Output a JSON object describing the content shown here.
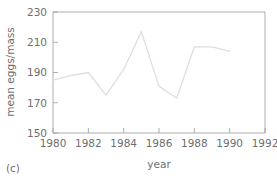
{
  "chart_data": {
    "type": "line",
    "title": "",
    "xlabel": "year",
    "ylabel": "mean eggs/mass",
    "xlim": [
      1980,
      1992
    ],
    "ylim": [
      150,
      230
    ],
    "xticks": [
      1980,
      1982,
      1984,
      1986,
      1988,
      1990,
      1992
    ],
    "xtick_labels": [
      "1980",
      "1982",
      "1984",
      "1986",
      "1988",
      "1990",
      "1992"
    ],
    "yticks": [
      150,
      170,
      190,
      210,
      230
    ],
    "ytick_labels": [
      "150",
      "170",
      "190",
      "210",
      "230"
    ],
    "grid": false,
    "legend": null,
    "line_color": "#dedede",
    "axis_color": "#9a9a9a",
    "text_color": "#6e6e6e",
    "x": [
      1980,
      1981,
      1982,
      1983,
      1984,
      1985,
      1986,
      1987,
      1988,
      1989,
      1990
    ],
    "values": [
      185,
      188,
      190,
      175,
      192,
      217,
      181,
      173,
      207,
      207,
      204
    ],
    "series": [
      {
        "name": "mean eggs/mass",
        "x": [
          1980,
          1981,
          1982,
          1983,
          1984,
          1985,
          1986,
          1987,
          1988,
          1989,
          1990
        ],
        "values": [
          185,
          188,
          190,
          175,
          192,
          217,
          181,
          173,
          207,
          207,
          204
        ]
      }
    ]
  },
  "panel": {
    "label": "(c)"
  },
  "axes": {
    "y_title": "mean eggs/mass",
    "x_title": "year"
  }
}
